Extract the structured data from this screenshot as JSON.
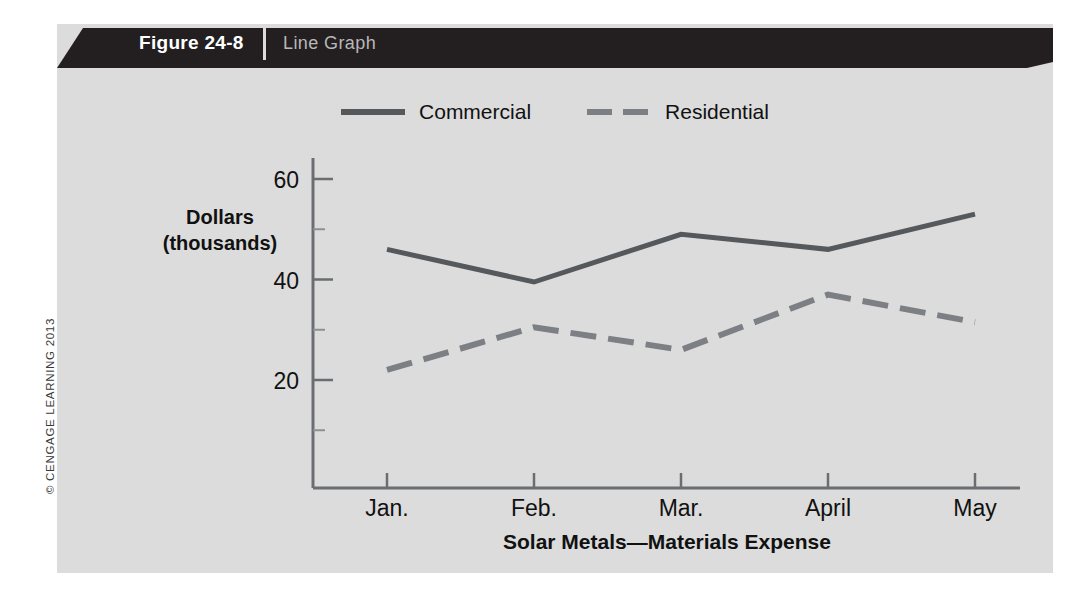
{
  "figure": {
    "number_label": "Figure 24-8",
    "title": "Line Graph",
    "credit": "© CENGAGE LEARNING 2013",
    "frame_color": "#dcdcdc",
    "header_color": "#231f20"
  },
  "legend": {
    "position": "top-center",
    "items": [
      {
        "label": "Commercial",
        "style": "solid",
        "color": "#55595c"
      },
      {
        "label": "Residential",
        "style": "dashed",
        "color": "#7c8084"
      }
    ]
  },
  "chart_data": {
    "type": "line",
    "title": "",
    "xlabel": "Solar Metals—Materials Expense",
    "ylabel": "Dollars (thousands)",
    "ylabel_line1": "Dollars",
    "ylabel_line2": "(thousands)",
    "categories": [
      "Jan.",
      "Feb.",
      "Mar.",
      "April",
      "May"
    ],
    "series": [
      {
        "name": "Commercial",
        "style": "solid",
        "color": "#55595c",
        "values": [
          46,
          39.5,
          49,
          46,
          53
        ]
      },
      {
        "name": "Residential",
        "style": "dashed",
        "color": "#7c8084",
        "values": [
          22,
          30.5,
          26,
          37,
          31.5
        ]
      }
    ],
    "ylim": [
      0,
      65
    ],
    "yticks": [
      20,
      40,
      60
    ],
    "ytick_labels": [
      "20",
      "40",
      "60"
    ],
    "yminor_ticks": [
      10,
      30,
      50
    ],
    "grid": false,
    "legend_position": "top-center"
  }
}
